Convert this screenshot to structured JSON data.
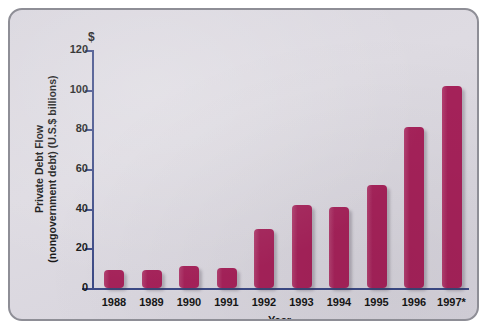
{
  "chart_data": {
    "type": "bar",
    "title": "",
    "xlabel": "Year",
    "ylabel_line1": "Private Debt Flow",
    "ylabel_line2": "(nongovernment debt) (U.S.$ billions)",
    "currency_symbol": "$",
    "categories": [
      "1988",
      "1989",
      "1990",
      "1991",
      "1992",
      "1993",
      "1994",
      "1995",
      "1996",
      "1997*"
    ],
    "values": [
      9,
      9,
      11,
      10,
      30,
      42,
      41,
      52,
      81,
      102
    ],
    "ylim": [
      0,
      120
    ],
    "ytick_labels": [
      "0",
      "20",
      "40",
      "60",
      "80",
      "100",
      "120"
    ],
    "ytick_values": [
      0,
      20,
      40,
      60,
      80,
      100,
      120
    ],
    "grid": false,
    "legend": false,
    "bar_color": "#a6225a",
    "axis_color": "#3c4a86",
    "background_color": "#dedbe2",
    "border_color": "#8e8e96"
  }
}
